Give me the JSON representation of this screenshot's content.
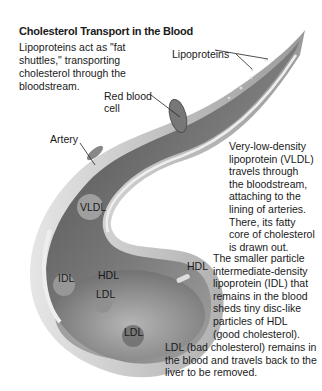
{
  "title": "Cholesterol Transport in the Blood",
  "intro": "Lipoproteins act as \"fat shuttles,\" transporting cholesterol through the bloodstream.",
  "labels": {
    "lipoproteins": "Lipoproteins",
    "red_blood_cell_line1": "Red blood",
    "red_blood_cell_line2": "cell",
    "artery": "Artery",
    "vldl": "VLDL",
    "idl": "IDL",
    "hdl_inner": "HDL",
    "ldl_inner": "LDL",
    "hdl_outer": "HDL",
    "ldl_lower": "LDL"
  },
  "descriptions": {
    "vldl": [
      "Very-low-density",
      "lipoprotein (VLDL)",
      "travels through",
      "the bloodstream,",
      "attaching to the",
      "lining of arteries.",
      "There, its fatty",
      "core of cholesterol",
      "is drawn out."
    ],
    "idl": [
      "The smaller particle",
      "intermediate-density",
      "lipoprotein (IDL) that",
      "remains in the blood",
      "sheds tiny disc-like",
      "particles of HDL",
      "(good cholesterol)."
    ],
    "ldl": [
      "LDL (bad cholesterol) remains in",
      "the blood and travels back to the",
      "liver to be removed."
    ]
  },
  "colors": {
    "artery_dark": "#5a5a5a",
    "artery_mid": "#8a8a8a",
    "artery_light": "#c8c8c8",
    "text": "#1a1a1a"
  }
}
